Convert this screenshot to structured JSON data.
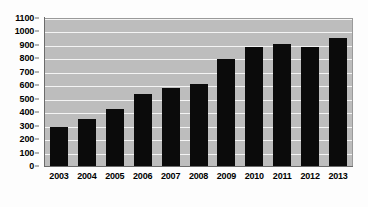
{
  "chart_data": {
    "type": "bar",
    "title": "",
    "subtitle": "",
    "xlabel": "",
    "ylabel": "",
    "categories": [
      "2003",
      "2004",
      "2005",
      "2006",
      "2007",
      "2008",
      "2009",
      "2010",
      "2011",
      "2012",
      "2013"
    ],
    "values": [
      300,
      360,
      430,
      545,
      590,
      615,
      805,
      895,
      915,
      890,
      960
    ],
    "series": [
      {
        "name": "",
        "values": [
          300,
          360,
          430,
          545,
          590,
          615,
          805,
          895,
          915,
          890,
          960
        ]
      }
    ],
    "ylim": [
      0,
      1100
    ],
    "ytick_step": 100,
    "yticks": [
      0,
      100,
      200,
      300,
      400,
      500,
      600,
      700,
      800,
      900,
      1000,
      1100
    ],
    "ytick_labels": [
      "0",
      "100",
      "200",
      "300",
      "400",
      "500",
      "600",
      "700",
      "800",
      "900",
      "1000",
      "1100"
    ],
    "grid": true,
    "grid_axis": "y",
    "legend": false,
    "legend_position": "none",
    "annotations": [],
    "colors": {
      "bar": "#0b0b0b",
      "plot_background": "#bdbdbd",
      "gridline": "#f4f4f4",
      "axis": "#6b6b6b",
      "figure_background": "#fdfdfd",
      "tick_label": "#000000"
    }
  }
}
